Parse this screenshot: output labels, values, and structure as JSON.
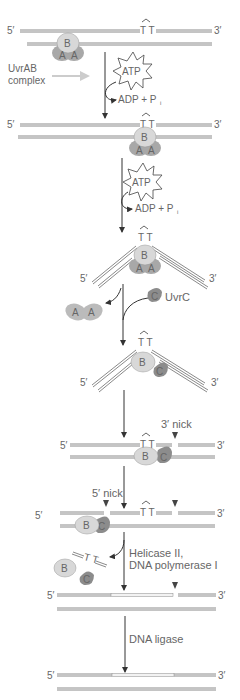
{
  "colors": {
    "strand": "#8a8a8a",
    "protein_light": "#d8d8d8",
    "protein_dark": "#8c8c8c",
    "arrow": "#333333",
    "text": "#666666",
    "new_strand": "#f2f2f2"
  },
  "labels": {
    "five_prime": "5′",
    "three_prime": "3′",
    "dimer": "T T",
    "uvrab_complex_line1": "UvrAB",
    "uvrab_complex_line2": "complex",
    "atp": "ATP",
    "adp": "ADP + P",
    "adp_sub": "i",
    "uvra": "A",
    "uvrb": "B",
    "uvrc": "C",
    "uvrc_label": "UvrC",
    "three_nick": "3′ nick",
    "five_nick": "5′ nick",
    "helicase_line1": "Helicase II,",
    "helicase_line2": "DNA polymerase I",
    "ligase": "DNA ligase"
  },
  "steps": [
    "UvrAB complex binds DNA",
    "ATP hydrolysis: complex translocates to thymine dimer",
    "ATP hydrolysis: DNA bends at lesion",
    "UvrA dimer released, UvrC binds",
    "3′ nick made",
    "5′ nick made",
    "Helicase II and DNA polymerase I remove fragment and fill gap",
    "DNA ligase seals nick"
  ]
}
